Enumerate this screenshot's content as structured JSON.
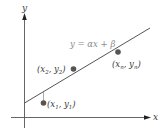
{
  "diagram": {
    "type": "linear-regression",
    "axes": {
      "x_label": "x",
      "y_label": "y"
    },
    "regression_line": {
      "equation": "y = αx + β",
      "color": "#555555"
    },
    "points": [
      {
        "label_base_x": "x",
        "sub_x": "1",
        "label_base_y": "y",
        "sub_y": "1",
        "label": "(x1, y1)"
      },
      {
        "label_base_x": "x",
        "sub_x": "2",
        "label_base_y": "y",
        "sub_y": "2",
        "label": "(x2, y2)"
      },
      {
        "label_base_x": "x",
        "sub_x": "n",
        "label_base_y": "y",
        "sub_y": "n",
        "label": "(xn, yn)"
      }
    ],
    "colors": {
      "axis": "#3a3a3a",
      "point": "#555555",
      "equation_text": "#8a8a8a"
    }
  }
}
